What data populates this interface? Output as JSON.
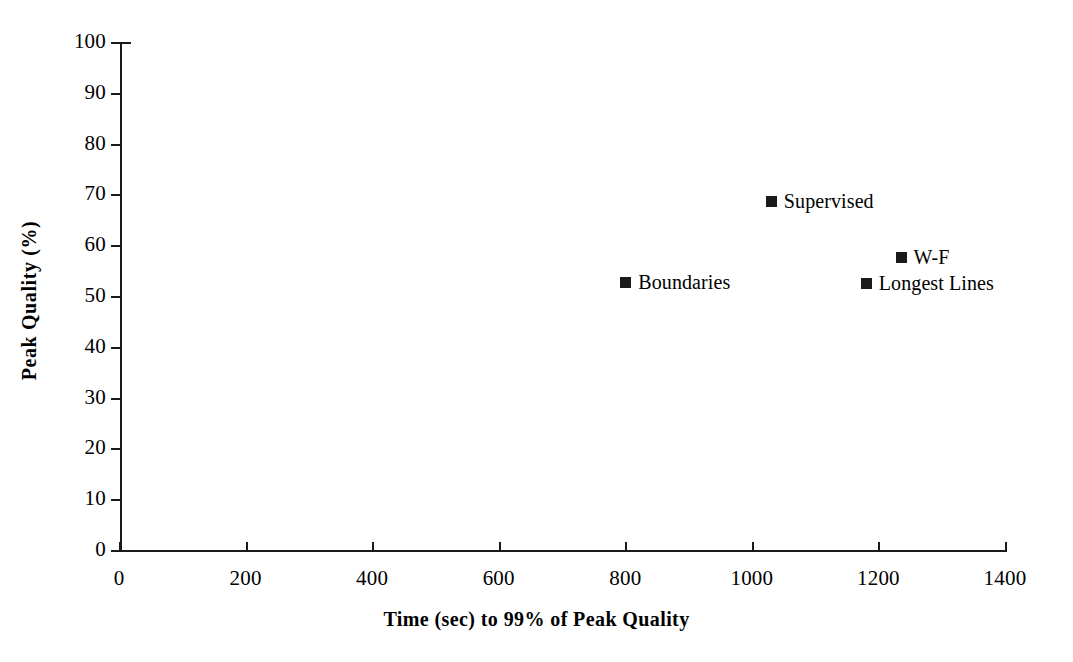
{
  "chart_data": {
    "type": "scatter",
    "title": "",
    "xlabel": "Time (sec) to 99% of Peak Quality",
    "ylabel": "Peak Quality (%)",
    "xlim": [
      0,
      1400
    ],
    "ylim": [
      0,
      100
    ],
    "xticks": [
      0,
      200,
      400,
      600,
      800,
      1000,
      1200,
      1400
    ],
    "yticks": [
      0,
      10,
      20,
      30,
      40,
      50,
      60,
      70,
      80,
      90,
      100
    ],
    "xtick_labels": [
      "0",
      "200",
      "400",
      "600",
      "800",
      "1000",
      "1200",
      "1400"
    ],
    "ytick_labels": [
      "0",
      "10",
      "20",
      "30",
      "40",
      "50",
      "60",
      "70",
      "80",
      "90",
      "100"
    ],
    "grid": false,
    "legend": "inline point labels",
    "marker_color": "#1a1a1a",
    "marker_shape": "square",
    "points": [
      {
        "label": "Supervised",
        "x": 1030,
        "y": 68.7
      },
      {
        "label": "W-F",
        "x": 1235,
        "y": 57.7
      },
      {
        "label": "Boundaries",
        "x": 800,
        "y": 52.8
      },
      {
        "label": "Longest Lines",
        "x": 1180,
        "y": 52.6
      }
    ]
  },
  "colors": {
    "background": "#ffffff",
    "ink": "#1a1a1a"
  }
}
